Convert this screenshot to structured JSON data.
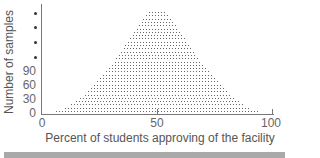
{
  "chart_data": {
    "type": "scatter",
    "subtype": "dot-plot",
    "title": "",
    "xlabel": "Percent of students approving of the facility",
    "ylabel": "Number of samples",
    "xlim": [
      0,
      100
    ],
    "x_ticks": [
      0,
      50,
      100
    ],
    "y_ticks": [
      "0",
      "30",
      "60",
      "90",
      "•",
      "•",
      "•",
      "•"
    ],
    "grid": false,
    "legend": null,
    "center": 50,
    "rows_top_to_bottom_dot_counts": [
      6,
      8,
      10,
      11,
      13,
      14,
      16,
      17,
      19,
      20,
      22,
      23,
      25,
      26,
      28,
      29,
      31,
      33,
      35,
      37,
      39,
      41,
      43,
      45,
      47,
      49,
      52,
      55,
      58,
      62,
      68
    ]
  },
  "axes": {
    "x_tick_labels": [
      "0",
      "50",
      "100"
    ],
    "y_tick_labels": [
      "0",
      "30",
      "60",
      "90"
    ],
    "y_continuation_bullets": 4
  },
  "labels": {
    "xlabel": "Percent of students approving of the facility",
    "ylabel": "Number of samples"
  }
}
